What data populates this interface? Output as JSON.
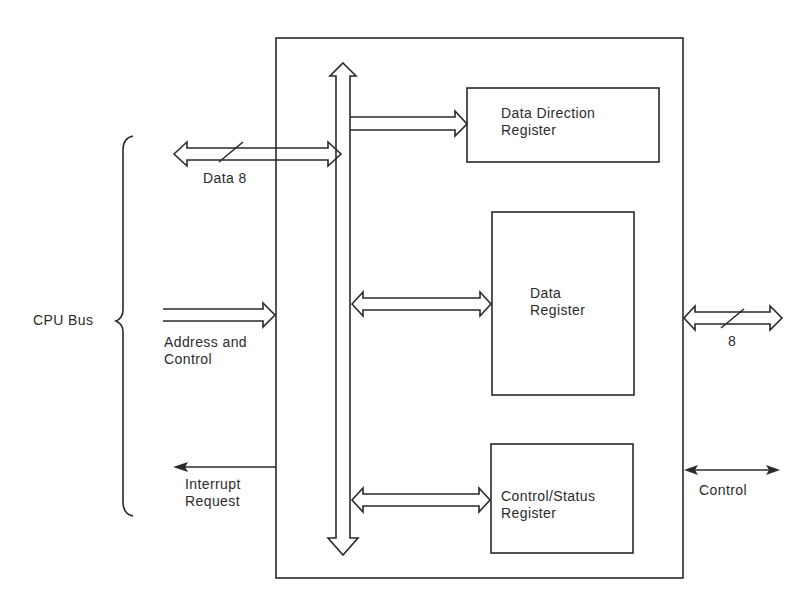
{
  "diagram": {
    "type": "block-diagram",
    "cpu_side": {
      "group_label": "CPU Bus",
      "signals": [
        {
          "id": "data",
          "label": "Data 8",
          "width_marker": "8",
          "direction": "bidirectional",
          "bus": true
        },
        {
          "id": "address_control",
          "label_lines": [
            "Address and",
            "Control"
          ],
          "direction": "in",
          "bus": true
        },
        {
          "id": "interrupt",
          "label_lines": [
            "Interrupt",
            "Request"
          ],
          "direction": "out",
          "bus": false
        }
      ]
    },
    "internal_bus": {
      "label": "internal bus",
      "direction": "bidirectional"
    },
    "registers": [
      {
        "id": "ddr",
        "label_lines": [
          "Data Direction",
          "Register"
        ],
        "link": "write-only"
      },
      {
        "id": "dr",
        "label_lines": [
          "Data",
          "Register"
        ],
        "link": "bidirectional"
      },
      {
        "id": "csr",
        "label_lines": [
          "Control/Status",
          "Register"
        ],
        "link": "bidirectional"
      }
    ],
    "peripheral_side": {
      "signals": [
        {
          "id": "port_data",
          "label": "8",
          "width_marker": "8",
          "direction": "bidirectional",
          "bus": true
        },
        {
          "id": "port_control",
          "label": "Control",
          "direction": "bidirectional",
          "bus": false
        }
      ]
    },
    "colors": {
      "stroke": "#2a2a2a",
      "background": "#ffffff"
    }
  }
}
